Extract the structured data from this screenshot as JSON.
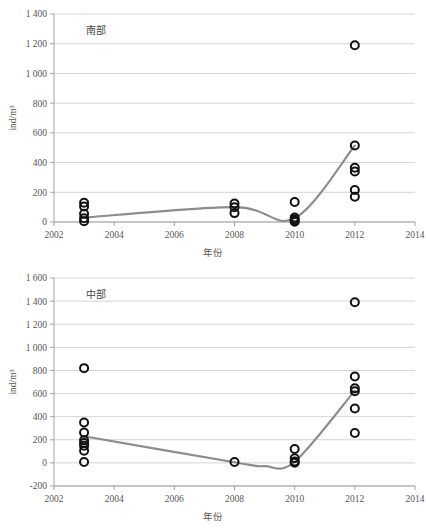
{
  "figure": {
    "background": "#ffffff",
    "point_color": "#111111",
    "trend_color": "#8c8c8c",
    "grid_color": "#c8c8c8"
  },
  "chart_data": [
    {
      "type": "scatter",
      "panel_id": "top",
      "title": "南部",
      "xlabel": "年份",
      "ylabel": "ind/m³",
      "xlim": [
        2002,
        2014
      ],
      "ylim": [
        0,
        1400
      ],
      "xticks": [
        2002,
        2004,
        2006,
        2008,
        2010,
        2012,
        2014
      ],
      "xticklabels": [
        "2002",
        "2004",
        "2006",
        "2008",
        "2010",
        "2012",
        "2014"
      ],
      "yticks": [
        0,
        200,
        400,
        600,
        800,
        1000,
        1200,
        1400
      ],
      "yticklabels": [
        "0",
        "200",
        "400",
        "600",
        "800",
        "1 000",
        "1 200",
        "1 400"
      ],
      "grid": true,
      "legend": "none",
      "series": [
        {
          "name": "观测值",
          "marker": "open-circle",
          "points": [
            {
              "x": 2003,
              "y": 130
            },
            {
              "x": 2003,
              "y": 105
            },
            {
              "x": 2003,
              "y": 55
            },
            {
              "x": 2003,
              "y": 25
            },
            {
              "x": 2003,
              "y": 5
            },
            {
              "x": 2008,
              "y": 125
            },
            {
              "x": 2008,
              "y": 100
            },
            {
              "x": 2008,
              "y": 60
            },
            {
              "x": 2010,
              "y": 135
            },
            {
              "x": 2010,
              "y": 30
            },
            {
              "x": 2010,
              "y": 18
            },
            {
              "x": 2010,
              "y": 8
            },
            {
              "x": 2010,
              "y": 2
            },
            {
              "x": 2012,
              "y": 1190
            },
            {
              "x": 2012,
              "y": 515
            },
            {
              "x": 2012,
              "y": 365
            },
            {
              "x": 2012,
              "y": 340
            },
            {
              "x": 2012,
              "y": 215
            },
            {
              "x": 2012,
              "y": 170
            }
          ]
        },
        {
          "name": "趋势线",
          "marker": "none",
          "line_points": [
            {
              "x": 2003,
              "y": 30
            },
            {
              "x": 2008,
              "y": 100
            },
            {
              "x": 2010,
              "y": 25
            },
            {
              "x": 2012,
              "y": 515
            }
          ]
        }
      ]
    },
    {
      "type": "scatter",
      "panel_id": "bottom",
      "title": "中部",
      "xlabel": "年份",
      "ylabel": "ind/m³",
      "xlim": [
        2002,
        2014
      ],
      "ylim": [
        -200,
        1600
      ],
      "xticks": [
        2002,
        2004,
        2006,
        2008,
        2010,
        2012,
        2014
      ],
      "xticklabels": [
        "2002",
        "2004",
        "2006",
        "2008",
        "2010",
        "2012",
        "2014"
      ],
      "yticks": [
        -200,
        0,
        200,
        400,
        600,
        800,
        1000,
        1200,
        1400,
        1600
      ],
      "yticklabels": [
        "-200",
        "0",
        "200",
        "400",
        "600",
        "800",
        "1 000",
        "1 200",
        "1 400",
        "1 600"
      ],
      "grid": true,
      "legend": "none",
      "series": [
        {
          "name": "观测值",
          "marker": "open-circle",
          "points": [
            {
              "x": 2003,
              "y": 820
            },
            {
              "x": 2003,
              "y": 350
            },
            {
              "x": 2003,
              "y": 262
            },
            {
              "x": 2003,
              "y": 195
            },
            {
              "x": 2003,
              "y": 172
            },
            {
              "x": 2003,
              "y": 148
            },
            {
              "x": 2003,
              "y": 105
            },
            {
              "x": 2003,
              "y": 8
            },
            {
              "x": 2008,
              "y": 8
            },
            {
              "x": 2010,
              "y": 120
            },
            {
              "x": 2010,
              "y": 40
            },
            {
              "x": 2010,
              "y": 12
            },
            {
              "x": 2010,
              "y": 2
            },
            {
              "x": 2012,
              "y": 1390
            },
            {
              "x": 2012,
              "y": 748
            },
            {
              "x": 2012,
              "y": 645
            },
            {
              "x": 2012,
              "y": 620
            },
            {
              "x": 2012,
              "y": 470
            },
            {
              "x": 2012,
              "y": 258
            }
          ]
        },
        {
          "name": "趋势线",
          "marker": "none",
          "line_points": [
            {
              "x": 2003,
              "y": 230
            },
            {
              "x": 2008,
              "y": 5
            },
            {
              "x": 2009,
              "y": -28
            },
            {
              "x": 2010,
              "y": 10
            },
            {
              "x": 2012,
              "y": 625
            }
          ]
        }
      ]
    }
  ]
}
